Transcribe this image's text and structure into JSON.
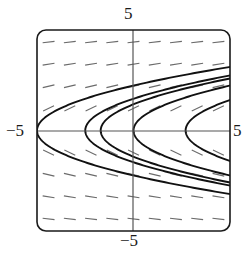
{
  "figure": {
    "title": "",
    "kind": "slope-field-with-solution-curves"
  },
  "axes": {
    "top_label": "5",
    "bottom_label": "−5",
    "left_label": "−5",
    "right_label": "5",
    "origin_px": {
      "x": 133,
      "y": 131
    },
    "frame_px": {
      "x0": 37,
      "y0": 30,
      "x1": 230,
      "y1": 231
    },
    "corner_radius_px": 9,
    "axis_color": "#555555",
    "frame_color": "#1a1a1a",
    "curve_color": "#111111",
    "field_color": "#6b6b6b",
    "background": "#ffffff"
  },
  "chart_data": {
    "type": "line",
    "title": "",
    "xlabel": "",
    "ylabel": "",
    "xlim": [
      -5,
      5
    ],
    "ylim": [
      -5,
      5
    ],
    "xticks": [
      -5,
      5
    ],
    "yticks": [
      -5,
      5
    ],
    "xtick_labels": [
      "−5",
      "5"
    ],
    "ytick_labels": [
      "−5",
      "5"
    ],
    "grid": false,
    "legend": "none",
    "annotations": [
      "Slope field of dy/dx = 1/(2y)",
      "Solution curves are sideways parabolas x = y^2 + C"
    ],
    "slope_field": {
      "description": "short dashed tangent segments on a regular grid; slope = 1/(2y)",
      "x_samples": [
        -4.4,
        -3.3,
        -2.2,
        -1.1,
        0.0,
        1.1,
        2.2,
        3.3,
        4.4
      ],
      "y_samples": [
        4.4,
        3.3,
        2.2,
        1.1,
        -1.1,
        -2.2,
        -3.3,
        -4.4
      ],
      "segment_length": 0.62,
      "slope_formula": "1/(2y)"
    },
    "series": [
      {
        "name": "x = y^2 - 5.0",
        "C": -5.0,
        "vertex": [
          -5.0,
          0
        ]
      },
      {
        "name": "x = y^2 - 2.5",
        "C": -2.5,
        "vertex": [
          -2.5,
          0
        ]
      },
      {
        "name": "x = y^2 - 1.7",
        "C": -1.7,
        "vertex": [
          -1.7,
          0
        ]
      },
      {
        "name": "x = y^2 + 0.0",
        "C": 0.0,
        "vertex": [
          0.0,
          0
        ]
      },
      {
        "name": "x = y^2 + 2.7",
        "C": 2.7,
        "vertex": [
          2.7,
          0
        ]
      }
    ]
  }
}
